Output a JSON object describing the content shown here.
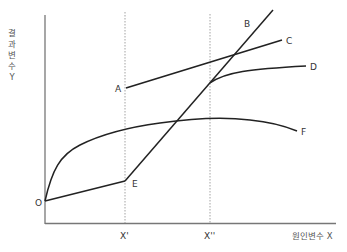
{
  "diagram": {
    "y_axis_label": "결과변수 Y",
    "x_axis_label": "원인변수 X",
    "x_ticks": [
      {
        "label": "X'",
        "x": 125
      },
      {
        "label": "X''",
        "x": 210
      }
    ],
    "points": {
      "O": {
        "label": "O",
        "x": 45,
        "y": 201
      },
      "A": {
        "label": "A",
        "x": 126,
        "y": 128
      },
      "E": {
        "label": "E",
        "x": 125,
        "y": 181
      }
    },
    "curves": [
      {
        "name": "B",
        "label": "B",
        "type": "line",
        "description": "Steep line from E upward through X'' to top right"
      },
      {
        "name": "C",
        "label": "C",
        "type": "line",
        "description": "Line from A rising gently to right"
      },
      {
        "name": "D",
        "label": "D",
        "type": "concave-curve",
        "description": "Concave curve starting at B∩X''"
      },
      {
        "name": "E",
        "label": "E",
        "type": "line",
        "description": "Shallow line from O to E at X'"
      },
      {
        "name": "F",
        "label": "F",
        "type": "inverted-U-curve",
        "description": "Rises steeply from O, peaks, then declines"
      }
    ],
    "colors": {
      "axis": "#777777",
      "curve": "#222222",
      "dashed": "#999999",
      "text": "#333333"
    }
  }
}
